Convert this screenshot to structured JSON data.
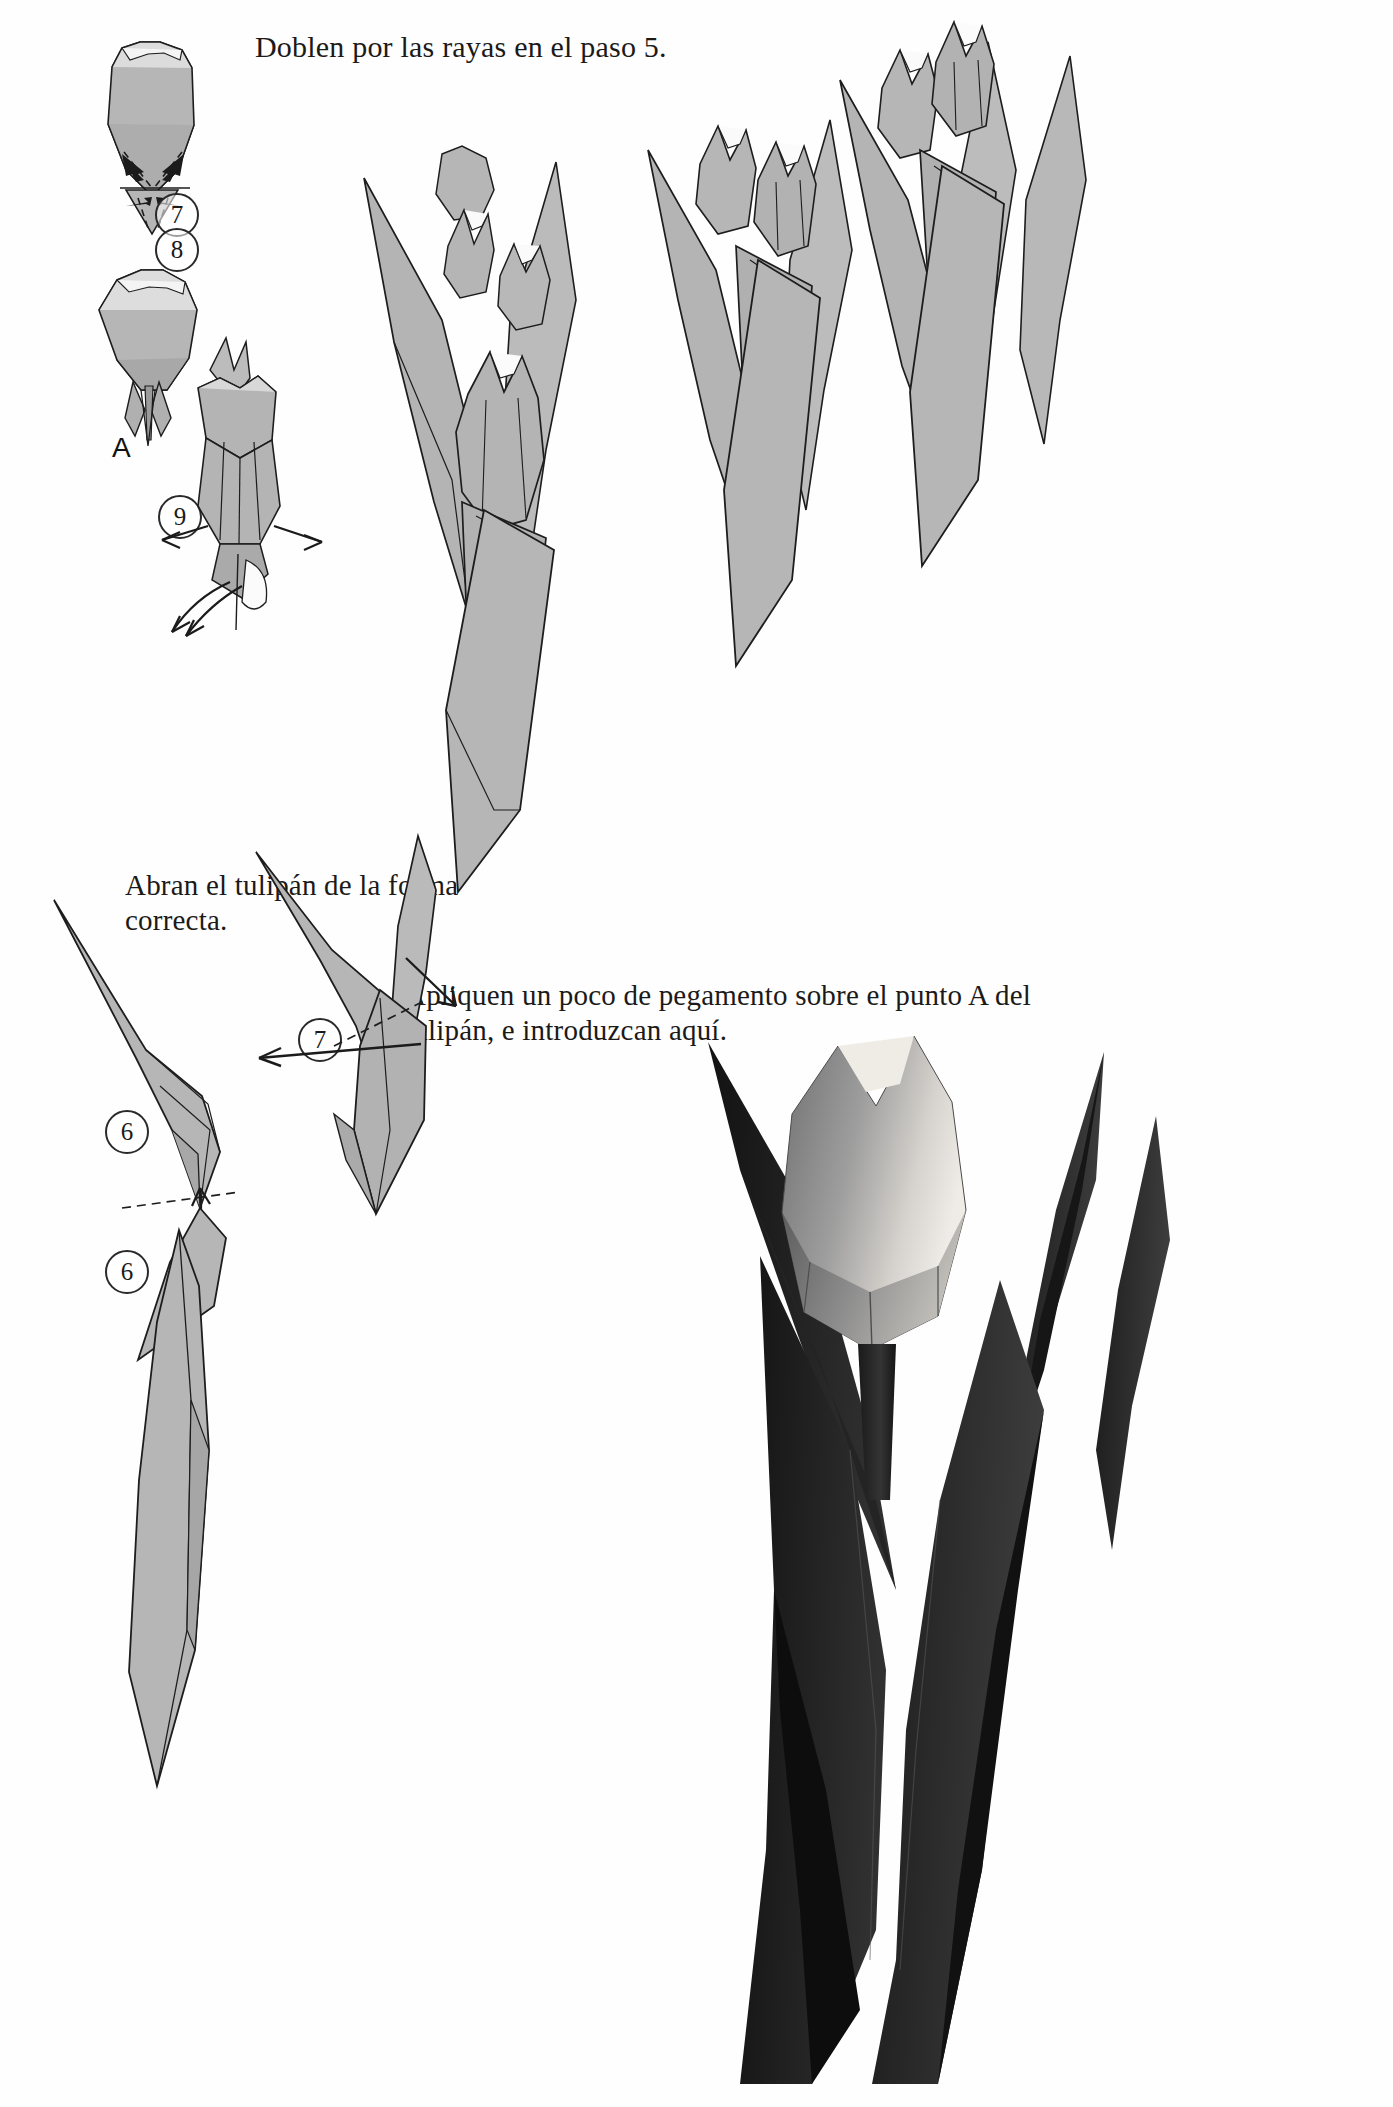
{
  "page": {
    "language": "es",
    "background": "#fefefe",
    "ink": "#1a1a1a",
    "paper_fill": "#b3b3b3",
    "paper_fill_light": "#c8c8c8",
    "paper_fill_dark": "#9a9a9a",
    "photo_dark": "#171717"
  },
  "captions": {
    "title": "Doblen por las rayas en el paso 5.",
    "open_tulip": "Abran el tulipán de la forma correcta.",
    "glue": "Apliquen un poco de pegamento sobre el punto A del tulipán, e introduzcan aquí."
  },
  "step_labels": {
    "bud_creases": "7",
    "bud_folded": "8",
    "bud_open": "9",
    "leaf_upper": "6",
    "leaf_lower": "6",
    "leaf_fold": "7"
  },
  "point_labels": {
    "glue_point": "A"
  },
  "figures": [
    {
      "name": "bud-crease-diagram",
      "step": "7",
      "description": "Cerrado de tulipán con rayas punteadas y flechas de plegado"
    },
    {
      "name": "bud-folded-diagram",
      "step": "8",
      "description": "Tulipán plegado mostrando el punto A"
    },
    {
      "name": "bud-open-diagram",
      "step": "9",
      "description": "Tulipán abriéndose con flechas en cuatro direcciones"
    },
    {
      "name": "tulip-illustration-1",
      "step": "",
      "description": "Tulipán terminado con hojas largas"
    },
    {
      "name": "tulip-illustration-2",
      "step": "",
      "description": "Tulipán terminado con hojas largas"
    },
    {
      "name": "tulip-illustration-3",
      "step": "",
      "description": "Tulipán terminado con hojas largas"
    },
    {
      "name": "leaf-diagram-upper",
      "step": "6",
      "description": "Hoja con línea de valle y flecha de giro"
    },
    {
      "name": "leaf-diagram-lower",
      "step": "6",
      "description": "Hoja terminada"
    },
    {
      "name": "leaf-fold-diagram",
      "step": "7",
      "description": "Hoja con raya punteada y flecha de doblez"
    },
    {
      "name": "finished-tulip-photo",
      "step": "",
      "description": "Fotografía del tulipán de papel terminado"
    }
  ]
}
